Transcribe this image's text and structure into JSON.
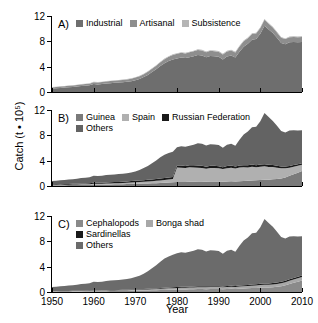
{
  "figure": {
    "ylabel": "Catch (t • 10⁵)",
    "xlabel": "Year",
    "ylim": [
      0,
      12
    ],
    "xlim": [
      1950,
      2010
    ],
    "yticks": [
      "0",
      "4",
      "8",
      "12"
    ],
    "ytick_values": [
      0,
      4,
      8,
      12
    ],
    "xticks": [
      "1950",
      "1960",
      "1970",
      "1980",
      "1990",
      "2000",
      "2010"
    ],
    "xtick_values": [
      1950,
      1960,
      1970,
      1980,
      1990,
      2000,
      2010
    ]
  },
  "colors": {
    "industrial": "#6e6e6e",
    "artisanal": "#8e8e8e",
    "subsistence": "#b5b5b5",
    "guinea": "#7a7a7a",
    "spain": "#b0b0b0",
    "russian_federation": "#1a1a1a",
    "others_b": "#636363",
    "cephalopods": "#8a8a8a",
    "bonga_shad": "#a8a8a8",
    "sardinellas": "#1a1a1a",
    "others_c": "#6b6b6b",
    "axis": "#000000",
    "background": "#ffffff"
  },
  "panels": [
    {
      "letter": "A)",
      "legend_rows": [
        [
          {
            "label": "Industrial",
            "color_key": "industrial",
            "name": "industrial"
          },
          {
            "label": "Artisanal",
            "color_key": "artisanal",
            "name": "artisanal"
          },
          {
            "label": "Subsistence",
            "color_key": "subsistence",
            "name": "subsistence"
          }
        ]
      ]
    },
    {
      "letter": "B)",
      "legend_rows": [
        [
          {
            "label": "Guinea",
            "color_key": "guinea",
            "name": "guinea"
          },
          {
            "label": "Spain",
            "color_key": "spain",
            "name": "spain"
          },
          {
            "label": "Russian Federation",
            "color_key": "russian_federation",
            "name": "russian-federation"
          }
        ],
        [
          {
            "label": "Others",
            "color_key": "others_b",
            "name": "others"
          }
        ]
      ]
    },
    {
      "letter": "C)",
      "legend_rows": [
        [
          {
            "label": "Cephalopods",
            "color_key": "cephalopods",
            "name": "cephalopods"
          },
          {
            "label": "Bonga shad",
            "color_key": "bonga_shad",
            "name": "bonga-shad"
          }
        ],
        [
          {
            "label": "Sardinellas",
            "color_key": "sardinellas",
            "name": "sardinellas"
          }
        ],
        [
          {
            "label": "Others",
            "color_key": "others_c",
            "name": "others"
          }
        ]
      ]
    }
  ],
  "chart_data": [
    {
      "type": "area",
      "panel": "A",
      "title": "Catch by sector",
      "xlabel": "Year",
      "ylabel": "Catch (t • 10^5)",
      "xlim": [
        1950,
        2010
      ],
      "ylim": [
        0,
        12
      ],
      "grid": false,
      "legend_position": "top-left",
      "stacked": true,
      "x": [
        1950,
        1951,
        1952,
        1953,
        1954,
        1955,
        1956,
        1957,
        1958,
        1959,
        1960,
        1961,
        1962,
        1963,
        1964,
        1965,
        1966,
        1967,
        1968,
        1969,
        1970,
        1971,
        1972,
        1973,
        1974,
        1975,
        1976,
        1977,
        1978,
        1979,
        1980,
        1981,
        1982,
        1983,
        1984,
        1985,
        1986,
        1987,
        1988,
        1989,
        1990,
        1991,
        1992,
        1993,
        1994,
        1995,
        1996,
        1997,
        1998,
        1999,
        2000,
        2001,
        2002,
        2003,
        2004,
        2005,
        2006,
        2007,
        2008,
        2009,
        2010
      ],
      "series": [
        {
          "name": "Industrial",
          "values": [
            0.55,
            0.6,
            0.65,
            0.7,
            0.75,
            0.8,
            0.85,
            0.95,
            1.0,
            1.05,
            1.25,
            1.2,
            1.25,
            1.35,
            1.4,
            1.45,
            1.5,
            1.55,
            1.6,
            1.7,
            1.85,
            2.05,
            2.35,
            2.7,
            3.15,
            3.6,
            4.1,
            4.55,
            4.9,
            5.15,
            5.3,
            5.45,
            5.35,
            5.5,
            5.65,
            5.85,
            5.75,
            5.5,
            5.7,
            5.65,
            5.55,
            5.15,
            5.6,
            5.75,
            5.45,
            6.35,
            7.15,
            7.6,
            8.25,
            8.35,
            9.2,
            10.45,
            9.85,
            9.3,
            8.55,
            7.75,
            7.55,
            7.85,
            7.9,
            7.85,
            7.9
          ]
        },
        {
          "name": "Artisanal",
          "values": [
            0.18,
            0.19,
            0.2,
            0.21,
            0.22,
            0.23,
            0.24,
            0.25,
            0.26,
            0.27,
            0.3,
            0.3,
            0.31,
            0.32,
            0.33,
            0.34,
            0.35,
            0.36,
            0.38,
            0.4,
            0.42,
            0.44,
            0.46,
            0.49,
            0.52,
            0.55,
            0.58,
            0.62,
            0.66,
            0.7,
            0.72,
            0.74,
            0.74,
            0.76,
            0.78,
            0.8,
            0.8,
            0.78,
            0.8,
            0.8,
            0.8,
            0.78,
            0.8,
            0.82,
            0.8,
            0.84,
            0.86,
            0.88,
            0.9,
            0.9,
            0.92,
            0.95,
            0.92,
            0.9,
            0.86,
            0.82,
            0.8,
            0.8,
            0.8,
            0.8,
            0.8
          ]
        },
        {
          "name": "Subsistence",
          "values": [
            0.04,
            0.04,
            0.04,
            0.04,
            0.05,
            0.05,
            0.05,
            0.05,
            0.05,
            0.05,
            0.06,
            0.06,
            0.06,
            0.06,
            0.06,
            0.06,
            0.06,
            0.07,
            0.07,
            0.07,
            0.07,
            0.08,
            0.08,
            0.08,
            0.09,
            0.09,
            0.09,
            0.1,
            0.1,
            0.1,
            0.1,
            0.1,
            0.1,
            0.1,
            0.1,
            0.11,
            0.11,
            0.1,
            0.11,
            0.11,
            0.11,
            0.1,
            0.11,
            0.11,
            0.11,
            0.11,
            0.12,
            0.12,
            0.12,
            0.12,
            0.12,
            0.12,
            0.12,
            0.12,
            0.11,
            0.11,
            0.11,
            0.11,
            0.11,
            0.11,
            0.11
          ]
        }
      ]
    },
    {
      "type": "area",
      "panel": "B",
      "title": "Catch by fishing country",
      "xlabel": "Year",
      "ylabel": "Catch (t • 10^5)",
      "xlim": [
        1950,
        2010
      ],
      "ylim": [
        0,
        12
      ],
      "grid": false,
      "legend_position": "top-left",
      "stacked": true,
      "x": [
        1950,
        1951,
        1952,
        1953,
        1954,
        1955,
        1956,
        1957,
        1958,
        1959,
        1960,
        1961,
        1962,
        1963,
        1964,
        1965,
        1966,
        1967,
        1968,
        1969,
        1970,
        1971,
        1972,
        1973,
        1974,
        1975,
        1976,
        1977,
        1978,
        1979,
        1980,
        1981,
        1982,
        1983,
        1984,
        1985,
        1986,
        1987,
        1988,
        1989,
        1990,
        1991,
        1992,
        1993,
        1994,
        1995,
        1996,
        1997,
        1998,
        1999,
        2000,
        2001,
        2002,
        2003,
        2004,
        2005,
        2006,
        2007,
        2008,
        2009,
        2010
      ],
      "series": [
        {
          "name": "Guinea",
          "values": [
            0.1,
            0.11,
            0.12,
            0.13,
            0.14,
            0.15,
            0.16,
            0.17,
            0.18,
            0.19,
            0.22,
            0.22,
            0.23,
            0.24,
            0.25,
            0.26,
            0.27,
            0.28,
            0.3,
            0.32,
            0.34,
            0.36,
            0.38,
            0.4,
            0.42,
            0.45,
            0.48,
            0.52,
            0.56,
            0.6,
            0.62,
            0.64,
            0.64,
            0.66,
            0.68,
            0.7,
            0.7,
            0.68,
            0.7,
            0.7,
            0.7,
            0.68,
            0.72,
            0.74,
            0.72,
            0.76,
            0.8,
            0.84,
            0.88,
            0.9,
            0.95,
            1.0,
            1.0,
            1.05,
            1.1,
            1.2,
            1.35,
            1.6,
            1.85,
            2.1,
            2.35
          ]
        },
        {
          "name": "Spain",
          "values": [
            0.05,
            0.06,
            0.06,
            0.07,
            0.07,
            0.08,
            0.08,
            0.09,
            0.09,
            0.1,
            0.12,
            0.12,
            0.13,
            0.14,
            0.15,
            0.16,
            0.17,
            0.18,
            0.2,
            0.22,
            0.24,
            0.26,
            0.28,
            0.3,
            0.33,
            0.36,
            0.4,
            0.44,
            0.48,
            0.52,
            2.3,
            2.25,
            2.2,
            2.3,
            2.25,
            2.2,
            2.15,
            2.05,
            2.15,
            2.15,
            2.1,
            2.0,
            2.1,
            2.15,
            2.05,
            2.15,
            2.15,
            2.1,
            2.15,
            2.05,
            2.1,
            2.1,
            2.0,
            1.95,
            1.8,
            1.6,
            1.45,
            1.3,
            1.2,
            1.1,
            1.0
          ]
        },
        {
          "name": "Russian Federation",
          "values": [
            0.1,
            0.1,
            0.11,
            0.11,
            0.12,
            0.12,
            0.13,
            0.14,
            0.14,
            0.15,
            0.16,
            0.17,
            0.17,
            0.18,
            0.19,
            0.2,
            0.2,
            0.21,
            0.22,
            0.23,
            0.24,
            0.25,
            0.26,
            0.27,
            0.28,
            0.29,
            0.3,
            0.3,
            0.31,
            0.32,
            0.33,
            0.33,
            0.32,
            0.33,
            0.34,
            0.34,
            0.33,
            0.32,
            0.33,
            0.33,
            0.32,
            0.3,
            0.32,
            0.33,
            0.31,
            0.33,
            0.34,
            0.34,
            0.35,
            0.34,
            0.35,
            0.35,
            0.34,
            0.33,
            0.31,
            0.29,
            0.28,
            0.27,
            0.26,
            0.25,
            0.25
          ]
        },
        {
          "name": "Others",
          "values": [
            0.52,
            0.56,
            0.6,
            0.64,
            0.69,
            0.73,
            0.77,
            0.85,
            0.9,
            0.93,
            1.11,
            1.05,
            1.09,
            1.16,
            1.18,
            1.21,
            1.24,
            1.28,
            1.29,
            1.35,
            1.47,
            1.65,
            1.91,
            2.2,
            2.58,
            2.94,
            3.34,
            3.66,
            3.86,
            3.98,
            2.87,
            3.07,
            3.03,
            3.07,
            3.26,
            3.52,
            3.48,
            3.33,
            3.43,
            3.38,
            3.34,
            3.05,
            3.37,
            3.46,
            3.28,
            4.06,
            4.84,
            5.32,
            5.89,
            6.08,
            6.84,
            8.07,
            7.55,
            6.94,
            6.31,
            5.59,
            5.38,
            5.59,
            5.5,
            5.31,
            5.21
          ]
        }
      ]
    },
    {
      "type": "area",
      "panel": "C",
      "title": "Catch by taxon",
      "xlabel": "Year",
      "ylabel": "Catch (t • 10^5)",
      "xlim": [
        1950,
        2010
      ],
      "ylim": [
        0,
        12
      ],
      "grid": false,
      "legend_position": "top-left",
      "stacked": true,
      "x": [
        1950,
        1951,
        1952,
        1953,
        1954,
        1955,
        1956,
        1957,
        1958,
        1959,
        1960,
        1961,
        1962,
        1963,
        1964,
        1965,
        1966,
        1967,
        1968,
        1969,
        1970,
        1971,
        1972,
        1973,
        1974,
        1975,
        1976,
        1977,
        1978,
        1979,
        1980,
        1981,
        1982,
        1983,
        1984,
        1985,
        1986,
        1987,
        1988,
        1989,
        1990,
        1991,
        1992,
        1993,
        1994,
        1995,
        1996,
        1997,
        1998,
        1999,
        2000,
        2001,
        2002,
        2003,
        2004,
        2005,
        2006,
        2007,
        2008,
        2009,
        2010
      ],
      "series": [
        {
          "name": "Cephalopods",
          "values": [
            0.06,
            0.06,
            0.07,
            0.07,
            0.08,
            0.08,
            0.09,
            0.09,
            0.1,
            0.1,
            0.12,
            0.12,
            0.13,
            0.13,
            0.14,
            0.15,
            0.15,
            0.16,
            0.17,
            0.18,
            0.19,
            0.2,
            0.22,
            0.24,
            0.26,
            0.28,
            0.3,
            0.32,
            0.34,
            0.36,
            0.38,
            0.4,
            0.4,
            0.42,
            0.44,
            0.46,
            0.46,
            0.45,
            0.47,
            0.47,
            0.47,
            0.45,
            0.48,
            0.5,
            0.48,
            0.52,
            0.55,
            0.58,
            0.62,
            0.64,
            0.68,
            0.72,
            0.72,
            0.76,
            0.82,
            0.92,
            1.05,
            1.25,
            1.45,
            1.62,
            1.8
          ]
        },
        {
          "name": "Bonga shad",
          "values": [
            0.04,
            0.04,
            0.05,
            0.05,
            0.05,
            0.06,
            0.06,
            0.06,
            0.07,
            0.07,
            0.08,
            0.08,
            0.09,
            0.09,
            0.1,
            0.1,
            0.11,
            0.11,
            0.12,
            0.13,
            0.14,
            0.15,
            0.16,
            0.17,
            0.18,
            0.19,
            0.21,
            0.22,
            0.24,
            0.25,
            0.26,
            0.27,
            0.27,
            0.28,
            0.29,
            0.3,
            0.3,
            0.29,
            0.3,
            0.3,
            0.3,
            0.29,
            0.31,
            0.32,
            0.31,
            0.33,
            0.35,
            0.36,
            0.38,
            0.39,
            0.41,
            0.43,
            0.43,
            0.44,
            0.46,
            0.48,
            0.5,
            0.52,
            0.53,
            0.54,
            0.55
          ]
        },
        {
          "name": "Sardinellas",
          "values": [
            0.03,
            0.03,
            0.03,
            0.03,
            0.04,
            0.04,
            0.04,
            0.04,
            0.04,
            0.05,
            0.05,
            0.05,
            0.05,
            0.06,
            0.06,
            0.06,
            0.06,
            0.07,
            0.07,
            0.07,
            0.08,
            0.08,
            0.09,
            0.09,
            0.1,
            0.1,
            0.11,
            0.12,
            0.12,
            0.13,
            0.13,
            0.14,
            0.14,
            0.14,
            0.15,
            0.15,
            0.15,
            0.15,
            0.15,
            0.15,
            0.15,
            0.14,
            0.15,
            0.16,
            0.15,
            0.16,
            0.17,
            0.18,
            0.18,
            0.19,
            0.2,
            0.21,
            0.21,
            0.21,
            0.22,
            0.22,
            0.23,
            0.23,
            0.23,
            0.23,
            0.24
          ]
        },
        {
          "name": "Others",
          "values": [
            0.64,
            0.7,
            0.74,
            0.8,
            0.85,
            0.9,
            0.96,
            1.06,
            1.1,
            1.15,
            1.36,
            1.33,
            1.35,
            1.45,
            1.5,
            1.54,
            1.59,
            1.64,
            1.68,
            1.79,
            1.94,
            2.14,
            2.42,
            2.77,
            3.22,
            3.67,
            4.15,
            4.61,
            4.92,
            5.13,
            5.35,
            5.48,
            5.38,
            5.52,
            5.65,
            5.85,
            5.75,
            5.49,
            5.69,
            5.64,
            5.54,
            5.15,
            5.57,
            5.7,
            5.42,
            6.29,
            7.06,
            7.48,
            8.09,
            8.15,
            8.95,
            10.16,
            9.53,
            8.91,
            8.02,
            7.06,
            6.68,
            6.76,
            6.6,
            6.37,
            6.22
          ]
        }
      ]
    }
  ]
}
